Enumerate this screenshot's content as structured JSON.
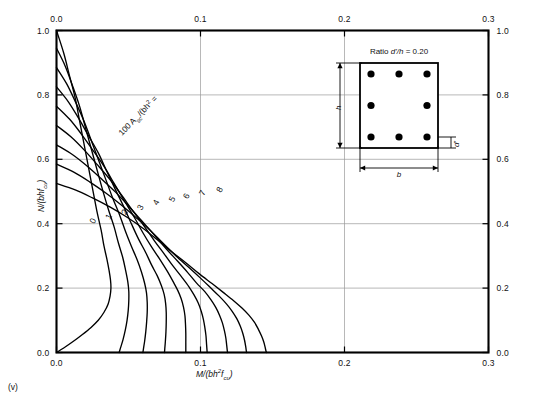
{
  "caption": "(v)",
  "axes": {
    "x_label": "M/(bh²f_cu)",
    "x_label_html": "M/(bh2fcu)",
    "y_label": "N/(bhf_cu)",
    "y_label_html": "N/(bhfcu)",
    "x_ticks": [
      "0.0",
      "0.1",
      "0.2",
      "0.3"
    ],
    "x_tick_values": [
      0.0,
      0.1,
      0.2,
      0.3
    ],
    "y_ticks": [
      "0.0",
      "0.2",
      "0.4",
      "0.6",
      "0.8",
      "1.0"
    ],
    "y_tick_values": [
      0.0,
      0.2,
      0.4,
      0.6,
      0.8,
      1.0
    ],
    "xlim": [
      0.0,
      0.3
    ],
    "ylim": [
      0.0,
      1.0
    ],
    "top_axis_ticks": [
      "0.0",
      "0.1",
      "0.2",
      "0.3"
    ],
    "right_axis_ticks": [
      "1.0",
      "0.8",
      "0.6",
      "0.4",
      "0.2",
      "0.0"
    ],
    "grid": true
  },
  "family_label": {
    "prefix": "100 A",
    "sub": "sc",
    "mid": "/(bh",
    "sup": ")",
    "suffix": " =",
    "full": "100 Asc/(bh) ="
  },
  "inset": {
    "title_prefix": "Ratio ",
    "title_italic": "d'/h",
    "title_value": " = 0.20",
    "title_full": "Ratio d'/h = 0.20",
    "dim_b": "b",
    "dim_h": "h",
    "dim_dprime": "d'",
    "bar_count": 8,
    "bar_rows": [
      3,
      2,
      3
    ],
    "dprime_over_h": 0.2
  },
  "colors": {
    "frame": "#000000",
    "grid": "#999999",
    "curve": "#000000",
    "background": "#ffffff"
  },
  "chart_data": {
    "type": "line",
    "title": "",
    "subtitle": "",
    "xlabel": "M/(bh²f_cu)",
    "ylabel": "N/(bhf_cu)",
    "xlim": [
      0.0,
      0.3
    ],
    "ylim": [
      0.0,
      1.0
    ],
    "grid": true,
    "legend_position": "inline-curve-labels",
    "annotations": [
      "100 Asc/(bh) =",
      "Ratio d'/h = 0.20"
    ],
    "series": [
      {
        "name": "0",
        "label": "0",
        "label_point": [
          0.027,
          0.405
        ],
        "points": [
          [
            0.0,
            1.0
          ],
          [
            0.005,
            0.93
          ],
          [
            0.009,
            0.86
          ],
          [
            0.013,
            0.79
          ],
          [
            0.016,
            0.72
          ],
          [
            0.019,
            0.65
          ],
          [
            0.022,
            0.58
          ],
          [
            0.025,
            0.51
          ],
          [
            0.028,
            0.44
          ],
          [
            0.031,
            0.38
          ],
          [
            0.033,
            0.33
          ],
          [
            0.035,
            0.29
          ],
          [
            0.0365,
            0.255
          ],
          [
            0.0375,
            0.225
          ],
          [
            0.0378,
            0.2
          ],
          [
            0.0372,
            0.175
          ],
          [
            0.0358,
            0.15
          ],
          [
            0.033,
            0.125
          ],
          [
            0.029,
            0.1
          ],
          [
            0.024,
            0.078
          ],
          [
            0.018,
            0.056
          ],
          [
            0.0115,
            0.034
          ],
          [
            0.005,
            0.014
          ],
          [
            0.0,
            0.0
          ]
        ]
      },
      {
        "name": "1",
        "label": "1",
        "label_point": [
          0.038,
          0.418
        ],
        "points": [
          [
            0.0,
            0.945
          ],
          [
            0.006,
            0.89
          ],
          [
            0.011,
            0.83
          ],
          [
            0.016,
            0.765
          ],
          [
            0.02,
            0.7
          ],
          [
            0.024,
            0.635
          ],
          [
            0.028,
            0.57
          ],
          [
            0.032,
            0.505
          ],
          [
            0.036,
            0.445
          ],
          [
            0.04,
            0.39
          ],
          [
            0.043,
            0.34
          ],
          [
            0.046,
            0.295
          ],
          [
            0.048,
            0.255
          ],
          [
            0.0495,
            0.22
          ],
          [
            0.0502,
            0.19
          ],
          [
            0.0502,
            0.16
          ],
          [
            0.0498,
            0.13
          ],
          [
            0.049,
            0.1
          ],
          [
            0.0478,
            0.07
          ],
          [
            0.0462,
            0.04
          ],
          [
            0.0445,
            0.015
          ],
          [
            0.0435,
            0.0
          ]
        ]
      },
      {
        "name": "2",
        "label": "2",
        "label_point": [
          0.049,
          0.432
        ],
        "points": [
          [
            0.0,
            0.885
          ],
          [
            0.007,
            0.835
          ],
          [
            0.013,
            0.78
          ],
          [
            0.019,
            0.72
          ],
          [
            0.024,
            0.66
          ],
          [
            0.029,
            0.6
          ],
          [
            0.034,
            0.54
          ],
          [
            0.039,
            0.48
          ],
          [
            0.044,
            0.425
          ],
          [
            0.048,
            0.375
          ],
          [
            0.052,
            0.33
          ],
          [
            0.056,
            0.288
          ],
          [
            0.059,
            0.25
          ],
          [
            0.0612,
            0.215
          ],
          [
            0.0625,
            0.185
          ],
          [
            0.063,
            0.155
          ],
          [
            0.063,
            0.125
          ],
          [
            0.0626,
            0.095
          ],
          [
            0.062,
            0.065
          ],
          [
            0.0612,
            0.035
          ],
          [
            0.0604,
            0.012
          ],
          [
            0.06,
            0.0
          ]
        ]
      },
      {
        "name": "3",
        "label": "3",
        "label_point": [
          0.06,
          0.447
        ],
        "points": [
          [
            0.0,
            0.825
          ],
          [
            0.008,
            0.78
          ],
          [
            0.015,
            0.73
          ],
          [
            0.022,
            0.675
          ],
          [
            0.029,
            0.62
          ],
          [
            0.035,
            0.562
          ],
          [
            0.041,
            0.505
          ],
          [
            0.047,
            0.45
          ],
          [
            0.052,
            0.4
          ],
          [
            0.057,
            0.352
          ],
          [
            0.062,
            0.31
          ],
          [
            0.066,
            0.272
          ],
          [
            0.07,
            0.238
          ],
          [
            0.0728,
            0.208
          ],
          [
            0.0748,
            0.18
          ],
          [
            0.0758,
            0.152
          ],
          [
            0.0762,
            0.124
          ],
          [
            0.0762,
            0.094
          ],
          [
            0.076,
            0.064
          ],
          [
            0.0756,
            0.034
          ],
          [
            0.0752,
            0.012
          ],
          [
            0.075,
            0.0
          ]
        ]
      },
      {
        "name": "4",
        "label": "4",
        "label_point": [
          0.071,
          0.462
        ],
        "points": [
          [
            0.0,
            0.765
          ],
          [
            0.009,
            0.725
          ],
          [
            0.017,
            0.68
          ],
          [
            0.025,
            0.63
          ],
          [
            0.033,
            0.578
          ],
          [
            0.04,
            0.525
          ],
          [
            0.047,
            0.472
          ],
          [
            0.054,
            0.42
          ],
          [
            0.06,
            0.372
          ],
          [
            0.066,
            0.328
          ],
          [
            0.072,
            0.288
          ],
          [
            0.077,
            0.252
          ],
          [
            0.081,
            0.22
          ],
          [
            0.0842,
            0.193
          ],
          [
            0.0866,
            0.167
          ],
          [
            0.0882,
            0.141
          ],
          [
            0.0892,
            0.114
          ],
          [
            0.0896,
            0.086
          ],
          [
            0.0898,
            0.058
          ],
          [
            0.0898,
            0.03
          ],
          [
            0.0898,
            0.01
          ],
          [
            0.0898,
            0.0
          ]
        ]
      },
      {
        "name": "5",
        "label": "5",
        "label_point": [
          0.082,
          0.472
        ],
        "points": [
          [
            0.0,
            0.705
          ],
          [
            0.01,
            0.67
          ],
          [
            0.019,
            0.63
          ],
          [
            0.028,
            0.585
          ],
          [
            0.037,
            0.538
          ],
          [
            0.045,
            0.49
          ],
          [
            0.053,
            0.44
          ],
          [
            0.061,
            0.392
          ],
          [
            0.068,
            0.347
          ],
          [
            0.075,
            0.305
          ],
          [
            0.081,
            0.268
          ],
          [
            0.087,
            0.234
          ],
          [
            0.092,
            0.204
          ],
          [
            0.0956,
            0.178
          ],
          [
            0.0985,
            0.153
          ],
          [
            0.1005,
            0.128
          ],
          [
            0.102,
            0.103
          ],
          [
            0.103,
            0.078
          ],
          [
            0.1038,
            0.052
          ],
          [
            0.1042,
            0.026
          ],
          [
            0.1045,
            0.008
          ],
          [
            0.1046,
            0.0
          ]
        ]
      },
      {
        "name": "6",
        "label": "6",
        "label_point": [
          0.092,
          0.482
        ],
        "points": [
          [
            0.0,
            0.645
          ],
          [
            0.011,
            0.615
          ],
          [
            0.021,
            0.58
          ],
          [
            0.031,
            0.54
          ],
          [
            0.041,
            0.498
          ],
          [
            0.05,
            0.455
          ],
          [
            0.059,
            0.41
          ],
          [
            0.068,
            0.365
          ],
          [
            0.076,
            0.323
          ],
          [
            0.084,
            0.284
          ],
          [
            0.091,
            0.249
          ],
          [
            0.097,
            0.217
          ],
          [
            0.103,
            0.189
          ],
          [
            0.1072,
            0.164
          ],
          [
            0.1106,
            0.14
          ],
          [
            0.1132,
            0.116
          ],
          [
            0.1152,
            0.092
          ],
          [
            0.1166,
            0.068
          ],
          [
            0.1176,
            0.045
          ],
          [
            0.1182,
            0.022
          ],
          [
            0.1186,
            0.006
          ],
          [
            0.1188,
            0.0
          ]
        ]
      },
      {
        "name": "7",
        "label": "7",
        "label_point": [
          0.103,
          0.492
        ],
        "points": [
          [
            0.0,
            0.585
          ],
          [
            0.012,
            0.56
          ],
          [
            0.023,
            0.53
          ],
          [
            0.034,
            0.496
          ],
          [
            0.045,
            0.458
          ],
          [
            0.055,
            0.42
          ],
          [
            0.065,
            0.38
          ],
          [
            0.074,
            0.339
          ],
          [
            0.083,
            0.3
          ],
          [
            0.092,
            0.264
          ],
          [
            0.1,
            0.231
          ],
          [
            0.107,
            0.201
          ],
          [
            0.113,
            0.175
          ],
          [
            0.118,
            0.151
          ],
          [
            0.122,
            0.128
          ],
          [
            0.1252,
            0.105
          ],
          [
            0.1276,
            0.082
          ],
          [
            0.1294,
            0.059
          ],
          [
            0.1306,
            0.038
          ],
          [
            0.1314,
            0.018
          ],
          [
            0.1318,
            0.005
          ],
          [
            0.132,
            0.0
          ]
        ]
      },
      {
        "name": "8",
        "label": "8",
        "label_point": [
          0.115,
          0.502
        ],
        "points": [
          [
            0.0,
            0.525
          ],
          [
            0.013,
            0.505
          ],
          [
            0.025,
            0.48
          ],
          [
            0.037,
            0.452
          ],
          [
            0.049,
            0.42
          ],
          [
            0.06,
            0.386
          ],
          [
            0.07,
            0.35
          ],
          [
            0.08,
            0.313
          ],
          [
            0.09,
            0.278
          ],
          [
            0.099,
            0.245
          ],
          [
            0.108,
            0.214
          ],
          [
            0.116,
            0.186
          ],
          [
            0.123,
            0.161
          ],
          [
            0.1288,
            0.138
          ],
          [
            0.1336,
            0.116
          ],
          [
            0.1374,
            0.094
          ],
          [
            0.1402,
            0.072
          ],
          [
            0.1424,
            0.051
          ],
          [
            0.144,
            0.032
          ],
          [
            0.145,
            0.014
          ],
          [
            0.1455,
            0.004
          ],
          [
            0.1458,
            0.0
          ]
        ]
      }
    ]
  }
}
